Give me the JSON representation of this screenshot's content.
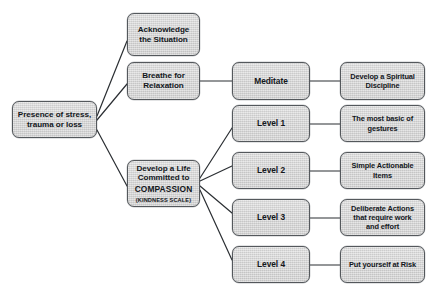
{
  "diagram": {
    "type": "flowchart",
    "orientation": "left-to-right",
    "background_color": "#ffffff",
    "node_fill_color": "#d6d6d6",
    "node_border_color": "#54585c",
    "text_color": "#13171c",
    "edge_color": "#2b2f33"
  },
  "nodes": {
    "root": {
      "label": "Presence of stress,\ntrauma or loss",
      "x": 12,
      "y": 101,
      "w": 85,
      "h": 37
    },
    "acknowledge": {
      "label": "Acknowledge\nthe Situation",
      "x": 127,
      "y": 13,
      "w": 73,
      "h": 43
    },
    "breathe": {
      "label": "Breathe for\nRelaxation",
      "x": 127,
      "y": 62,
      "w": 73,
      "h": 38
    },
    "compassion": {
      "line1": "Develop a Life\nCommitted to",
      "emph": "COMPASSION",
      "sub": "(KINDNESS SCALE)",
      "x": 127,
      "y": 160,
      "w": 73,
      "h": 47
    },
    "meditate": {
      "label": "Meditate",
      "x": 232,
      "y": 62,
      "w": 78,
      "h": 38
    },
    "level1": {
      "label": "Level 1",
      "x": 232,
      "y": 105,
      "w": 78,
      "h": 37
    },
    "level2": {
      "label": "Level 2",
      "x": 232,
      "y": 152,
      "w": 78,
      "h": 37
    },
    "level3": {
      "label": "Level 3",
      "x": 232,
      "y": 199,
      "w": 78,
      "h": 37
    },
    "level4": {
      "label": "Level 4",
      "x": 232,
      "y": 246,
      "w": 78,
      "h": 37
    },
    "spiritual": {
      "label": "Develop a Spiritual\nDiscipline",
      "x": 340,
      "y": 62,
      "w": 85,
      "h": 38
    },
    "gestures": {
      "label": "The most basic of\ngestures",
      "x": 340,
      "y": 105,
      "w": 85,
      "h": 37
    },
    "actionable": {
      "label": "Simple Actionable\nItems",
      "x": 340,
      "y": 152,
      "w": 85,
      "h": 37
    },
    "deliberate": {
      "label": "Deliberate Actions\nthat require work\nand effort",
      "x": 340,
      "y": 199,
      "w": 85,
      "h": 37
    },
    "risk": {
      "label": "Put yourself at Risk",
      "x": 340,
      "y": 246,
      "w": 85,
      "h": 37
    }
  },
  "edges": [
    {
      "from": "root",
      "to": "acknowledge",
      "x1": 97,
      "y1": 116,
      "x2": 127,
      "y2": 41
    },
    {
      "from": "root",
      "to": "breathe",
      "x1": 97,
      "y1": 120,
      "x2": 127,
      "y2": 84
    },
    {
      "from": "root",
      "to": "compassion",
      "x1": 97,
      "y1": 130,
      "x2": 127,
      "y2": 186
    },
    {
      "from": "breathe",
      "to": "meditate",
      "x1": 200,
      "y1": 81,
      "x2": 232,
      "y2": 81
    },
    {
      "from": "meditate",
      "to": "spiritual",
      "x1": 310,
      "y1": 81,
      "x2": 340,
      "y2": 81
    },
    {
      "from": "compassion",
      "to": "level1",
      "x1": 200,
      "y1": 178,
      "x2": 232,
      "y2": 128
    },
    {
      "from": "compassion",
      "to": "level2",
      "x1": 200,
      "y1": 181,
      "x2": 232,
      "y2": 166
    },
    {
      "from": "compassion",
      "to": "level3",
      "x1": 200,
      "y1": 186,
      "x2": 232,
      "y2": 213
    },
    {
      "from": "compassion",
      "to": "level4",
      "x1": 200,
      "y1": 190,
      "x2": 232,
      "y2": 260
    },
    {
      "from": "level1",
      "to": "gestures",
      "x1": 310,
      "y1": 124,
      "x2": 340,
      "y2": 124
    },
    {
      "from": "level2",
      "to": "actionable",
      "x1": 310,
      "y1": 171,
      "x2": 340,
      "y2": 171
    },
    {
      "from": "level3",
      "to": "deliberate",
      "x1": 310,
      "y1": 218,
      "x2": 340,
      "y2": 218
    },
    {
      "from": "level4",
      "to": "risk",
      "x1": 310,
      "y1": 265,
      "x2": 340,
      "y2": 265
    }
  ]
}
